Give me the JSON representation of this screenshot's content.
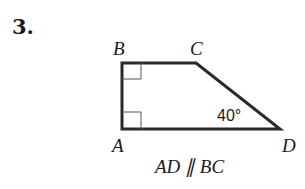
{
  "problem": {
    "number": "3."
  },
  "figure": {
    "shape": "trapezoid",
    "vertices": {
      "A": {
        "label": "A",
        "x": 122,
        "y": 129
      },
      "B": {
        "label": "B",
        "x": 122,
        "y": 63
      },
      "C": {
        "label": "C",
        "x": 196,
        "y": 63
      },
      "D": {
        "label": "D",
        "x": 280,
        "y": 129
      }
    },
    "right_angles": [
      "B",
      "A"
    ],
    "angle_label": {
      "vertex": "D",
      "text": "40°"
    },
    "caption": "AD ∥ BC",
    "colors": {
      "stroke": "#2a2a2a",
      "text": "#1a1a1a",
      "background": "#ffffff"
    }
  }
}
